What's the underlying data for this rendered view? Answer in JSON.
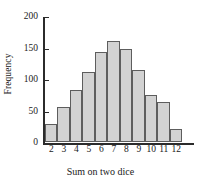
{
  "chart_data": {
    "type": "bar",
    "title": "",
    "xlabel": "Sum on two dice",
    "ylabel": "Frequency",
    "categories": [
      "2",
      "3",
      "4",
      "5",
      "6",
      "7",
      "8",
      "9",
      "10",
      "11",
      "12"
    ],
    "values": [
      29,
      56,
      83,
      111,
      143,
      160,
      148,
      115,
      74,
      63,
      21
    ],
    "ylim": [
      0,
      200
    ],
    "y_ticks": [
      0,
      50,
      100,
      150,
      200
    ],
    "y_tick_labels": [
      "0",
      "50",
      "100",
      "150",
      "200"
    ],
    "x_tick_labels": [
      "2",
      "3",
      "4",
      "5",
      "6",
      "7",
      "8",
      "9",
      "10",
      "11",
      "12"
    ],
    "grid": false,
    "legend": null,
    "bar_fill_color": "#d2d2d2",
    "bar_edge_color": "#5d5d5d",
    "axis_color": "#2b2b2b"
  }
}
